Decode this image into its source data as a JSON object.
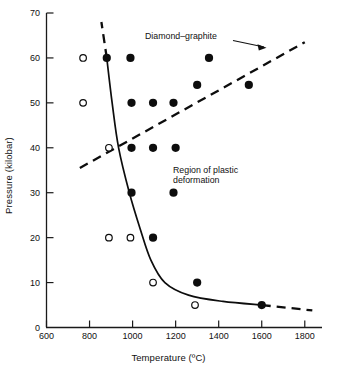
{
  "chart_data": {
    "type": "scatter",
    "title": "",
    "xlabel": "Temperature (ºC)",
    "ylabel": "Pressure (kilobar)",
    "xlim": [
      600,
      1880
    ],
    "ylim": [
      0,
      70
    ],
    "xticks": [
      600,
      800,
      1000,
      1200,
      1400,
      1600,
      1800
    ],
    "xtick_labels": [
      "600",
      "800",
      "1000",
      "1200",
      "1400",
      "1600",
      "1800"
    ],
    "yticks": [
      0,
      10,
      20,
      30,
      40,
      50,
      60,
      70
    ],
    "ytick_labels": [
      "0",
      "10",
      "20",
      "30",
      "40",
      "50",
      "60",
      "70"
    ],
    "grid": false,
    "legend": "none",
    "series": [
      {
        "name": "filled-circles",
        "marker": "filled-circle",
        "points": [
          {
            "x": 880,
            "y": 60
          },
          {
            "x": 990,
            "y": 60
          },
          {
            "x": 1355,
            "y": 60
          },
          {
            "x": 1300,
            "y": 54
          },
          {
            "x": 1540,
            "y": 54
          },
          {
            "x": 995,
            "y": 50
          },
          {
            "x": 1095,
            "y": 50
          },
          {
            "x": 1190,
            "y": 50
          },
          {
            "x": 995,
            "y": 40
          },
          {
            "x": 1095,
            "y": 40
          },
          {
            "x": 1200,
            "y": 40
          },
          {
            "x": 995,
            "y": 30
          },
          {
            "x": 1190,
            "y": 30
          },
          {
            "x": 1095,
            "y": 20
          },
          {
            "x": 1300,
            "y": 10
          },
          {
            "x": 1600,
            "y": 5
          }
        ]
      },
      {
        "name": "open-circles",
        "marker": "open-circle",
        "points": [
          {
            "x": 770,
            "y": 60
          },
          {
            "x": 770,
            "y": 50
          },
          {
            "x": 890,
            "y": 40
          },
          {
            "x": 890,
            "y": 20
          },
          {
            "x": 990,
            "y": 20
          },
          {
            "x": 1095,
            "y": 10
          },
          {
            "x": 1290,
            "y": 5
          }
        ]
      }
    ],
    "curves": [
      {
        "name": "plastic-deformation-boundary",
        "style": "solid",
        "points": [
          {
            "x": 880,
            "y": 60
          },
          {
            "x": 905,
            "y": 50
          },
          {
            "x": 935,
            "y": 40
          },
          {
            "x": 985,
            "y": 30
          },
          {
            "x": 1035,
            "y": 22
          },
          {
            "x": 1085,
            "y": 15
          },
          {
            "x": 1150,
            "y": 10
          },
          {
            "x": 1260,
            "y": 7.2
          },
          {
            "x": 1420,
            "y": 5.8
          },
          {
            "x": 1600,
            "y": 5
          }
        ]
      },
      {
        "name": "plastic-boundary-extension",
        "style": "dashed",
        "points": [
          {
            "x": 1600,
            "y": 5
          },
          {
            "x": 1835,
            "y": 3.8
          }
        ]
      },
      {
        "name": "plastic-boundary-upper-extension",
        "style": "dashed",
        "points": [
          {
            "x": 880,
            "y": 60
          },
          {
            "x": 855,
            "y": 68
          }
        ]
      },
      {
        "name": "diamond-graphite-equilibrium",
        "style": "dashed",
        "points": [
          {
            "x": 755,
            "y": 35.5
          },
          {
            "x": 1800,
            "y": 63.5
          }
        ]
      }
    ],
    "annotations": [
      {
        "name": "diamond-graphite-label",
        "text": "Diamond–graphite",
        "has_arrow": true
      },
      {
        "name": "plastic-region-label",
        "line1": "Region of plastic",
        "line2": "deformation",
        "has_arrow": false
      }
    ]
  },
  "style": {
    "axis_color": "#1a1a1a",
    "marker_fill": "#0d0d0d",
    "marker_open_stroke": "#0d0d0d",
    "curve_color": "#0d0d0d",
    "background": "#ffffff"
  }
}
